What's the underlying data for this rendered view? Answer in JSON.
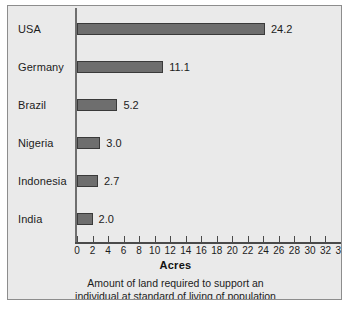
{
  "chart_data": {
    "type": "bar",
    "orientation": "horizontal",
    "title": "",
    "xlabel": "Acres",
    "ylabel": "",
    "xlim": [
      0,
      34
    ],
    "xtick_step": 2,
    "grid": false,
    "legend": null,
    "categories": [
      "USA",
      "Germany",
      "Brazil",
      "Nigeria",
      "Indonesia",
      "India"
    ],
    "values": [
      24.2,
      11.1,
      5.2,
      3.0,
      2.7,
      2.0
    ],
    "value_labels": [
      "24.2",
      "11.1",
      "5.2",
      "3.0",
      "2.7",
      "2.0"
    ],
    "xticks": [
      0,
      2,
      4,
      6,
      8,
      10,
      12,
      14,
      16,
      18,
      20,
      22,
      24,
      26,
      28,
      30,
      32,
      34
    ],
    "xtick_labels": [
      "0",
      "2",
      "4",
      "6",
      "8",
      "10",
      "12",
      "14",
      "16",
      "18",
      "20",
      "22",
      "24",
      "26",
      "28",
      "30",
      "32",
      "34"
    ],
    "caption_lines": [
      "Amount of land required to support an",
      "individual at standard of living of population"
    ],
    "colors": {
      "background": "#eaeaea",
      "frame": "#8d8d8d",
      "bar_fill": "#6e6e6e",
      "bar_stroke": "#3a3a3a",
      "axis": "#4a4a4a",
      "text": "#1c1c1c"
    }
  }
}
